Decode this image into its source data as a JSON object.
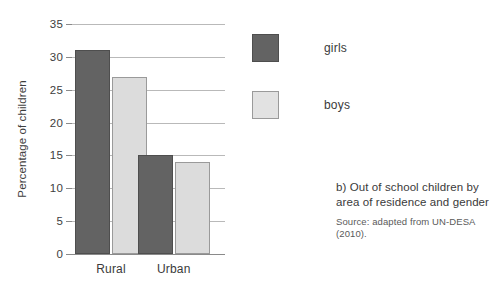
{
  "figure": {
    "caption_title": "b) Out of school children by area of residence and gender",
    "caption_source": "Source: adapted from UN-DESA (2010)."
  },
  "legend": {
    "position": "right",
    "entries": [
      {
        "label": "girls",
        "color": "#636363"
      },
      {
        "label": "boys",
        "color": "#dcdcdc"
      }
    ]
  },
  "chart_data": {
    "type": "bar",
    "title": "b) Out of school children by area of residence and gender",
    "xlabel": "",
    "ylabel": "Percentage of children",
    "categories": [
      "Rural",
      "Urban"
    ],
    "series": [
      {
        "name": "girls",
        "color": "#636363",
        "values": [
          31,
          15
        ]
      },
      {
        "name": "boys",
        "color": "#dcdcdc",
        "values": [
          27,
          14
        ]
      }
    ],
    "ylim": [
      0,
      35
    ],
    "yticks": [
      0,
      5,
      10,
      15,
      20,
      25,
      30,
      35
    ],
    "ytick_labels": [
      "0",
      "5",
      "10",
      "15",
      "20",
      "25",
      "30",
      "35"
    ],
    "grid": true,
    "grid_axis": "y",
    "legend": [
      "girls",
      "boys"
    ],
    "source": "adapted from UN-DESA (2010)"
  }
}
